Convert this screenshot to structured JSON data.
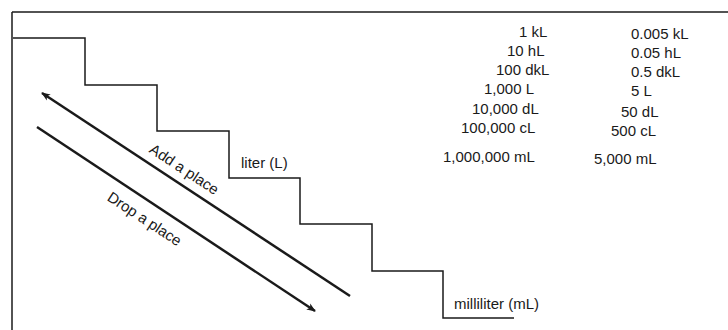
{
  "diagram": {
    "stroke_color": "#1a1a1a",
    "background": "#ffffff",
    "frame": {
      "top_y": 12,
      "left_x": 12
    },
    "staircase_points": [
      [
        13,
        38
      ],
      [
        85,
        38
      ],
      [
        85,
        85
      ],
      [
        157,
        85
      ],
      [
        157,
        131
      ],
      [
        229,
        131
      ],
      [
        229,
        178
      ],
      [
        300,
        178
      ],
      [
        300,
        224
      ],
      [
        372,
        224
      ],
      [
        372,
        271
      ],
      [
        443,
        271
      ],
      [
        443,
        318
      ],
      [
        514,
        318
      ]
    ],
    "labels": {
      "liter": "liter (L)",
      "milliliter": "milliliter (mL)",
      "add_place": "Add a place",
      "drop_place": "Drop a place"
    },
    "arrows": {
      "add": {
        "from": [
          350,
          296
        ],
        "to": [
          42,
          93
        ],
        "direction": "up-left"
      },
      "drop": {
        "from": [
          37,
          127
        ],
        "to": [
          315,
          311
        ],
        "direction": "down-right"
      }
    }
  },
  "conversions": {
    "equal_to_1_kL": [
      "1 kL",
      "10 hL",
      "100 dkL",
      "1,000 L",
      "10,000 dL",
      "100,000 cL",
      "1,000,000 mL"
    ],
    "equal_to_5_L": [
      "0.005 kL",
      "0.05 hL",
      "0.5 dkL",
      "5 L",
      "50 dL",
      "500 cL",
      "5,000 mL"
    ]
  }
}
